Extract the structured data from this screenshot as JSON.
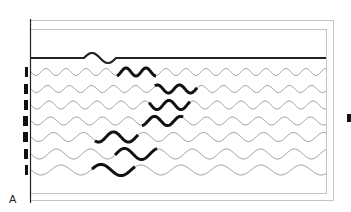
{
  "figure": {
    "panel_label": "A",
    "colors": {
      "frame": "#bdbdbd",
      "axis": "#222222",
      "trace": "#8a8a8a",
      "highlight": "#111111",
      "marker": "#111111"
    },
    "top_trace": {
      "y": 58,
      "wiggle_start_x": 84,
      "wiggle_end_x": 116
    },
    "traces": [
      {
        "index": 1,
        "y": 72,
        "period": 20,
        "amplitude": 3.5,
        "highlight_start": 117,
        "highlight_end": 156,
        "marker_width": 3
      },
      {
        "index": 2,
        "y": 89,
        "period": 22,
        "amplitude": 3.5,
        "highlight_start": 155,
        "highlight_end": 197,
        "marker_width": 4
      },
      {
        "index": 3,
        "y": 105,
        "period": 24,
        "amplitude": 4,
        "highlight_start": 149,
        "highlight_end": 190,
        "marker_width": 4
      },
      {
        "index": 4,
        "y": 121,
        "period": 26,
        "amplitude": 4,
        "highlight_start": 142,
        "highlight_end": 183,
        "marker_width": 5
      },
      {
        "index": 5,
        "y": 137,
        "period": 30,
        "amplitude": 4.5,
        "highlight_start": 95,
        "highlight_end": 138,
        "marker_width": 5
      },
      {
        "index": 6,
        "y": 154,
        "period": 34,
        "amplitude": 5,
        "highlight_start": 115,
        "highlight_end": 157,
        "marker_width": 4
      },
      {
        "index": 7,
        "y": 170,
        "period": 40,
        "amplitude": 5,
        "highlight_start": 92,
        "highlight_end": 135,
        "marker_width": 3
      }
    ]
  }
}
